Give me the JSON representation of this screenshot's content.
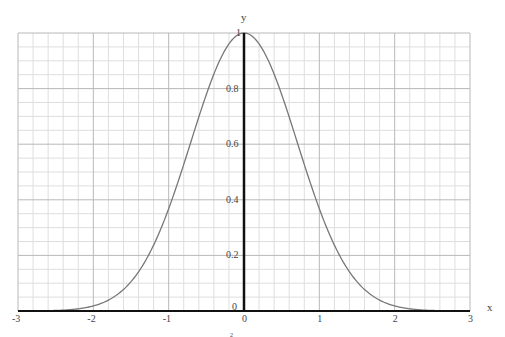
{
  "chart_data": {
    "type": "line",
    "title": "",
    "xlabel": "x",
    "ylabel": "y",
    "xlim": [
      -3,
      3
    ],
    "ylim": [
      0,
      1
    ],
    "grid": true,
    "x_ticks": [
      "-3",
      "-2",
      "-1",
      "0",
      "1",
      "2",
      "3"
    ],
    "y_ticks": [
      "0",
      "0.2",
      "0.4",
      "0.6",
      "0.8",
      "1"
    ],
    "series": [
      {
        "name": "y = e^(-x^2)",
        "function": "exp(-x^2)",
        "x": [
          -3,
          -2.5,
          -2,
          -1.5,
          -1,
          -0.5,
          0,
          0.5,
          1,
          1.5,
          2,
          2.5,
          3
        ],
        "values": [
          0.0001,
          0.0019,
          0.0183,
          0.1054,
          0.3679,
          0.7788,
          1,
          0.7788,
          0.3679,
          0.1054,
          0.0183,
          0.0019,
          0.0001
        ],
        "color": "#777777"
      }
    ],
    "bottom_annotation": "2"
  },
  "axis": {
    "x_label": "x",
    "y_label": "y",
    "origin_label": "0",
    "x_zero_label": "0"
  }
}
